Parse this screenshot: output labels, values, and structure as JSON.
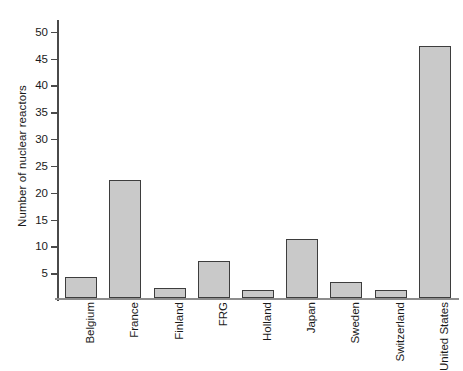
{
  "chart_data": {
    "type": "bar",
    "title": "",
    "xlabel": "",
    "ylabel": "Number of nuclear reactors",
    "categories": [
      "Belgium",
      "France",
      "Finland",
      "FRG",
      "Holland",
      "Japan",
      "Sweden",
      "Switzerland",
      "United States"
    ],
    "values": [
      4,
      22,
      2,
      7,
      1.5,
      11,
      3,
      1.5,
      47
    ],
    "ylim": [
      0,
      52
    ],
    "yticks": [
      5,
      10,
      15,
      20,
      25,
      30,
      35,
      40,
      45,
      50
    ],
    "ytick_labels": [
      "5",
      "10",
      "15",
      "20",
      "25",
      "30",
      "35",
      "40",
      "45",
      "50"
    ],
    "grid": false,
    "legend": false,
    "bar_fill_color": "#c9c9c9",
    "bar_border_color": "#3d3d3d",
    "axis_color": "#4a4a4a",
    "text_color": "#1a1a1a"
  }
}
